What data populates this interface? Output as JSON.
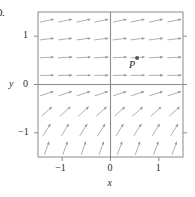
{
  "figure": {
    "number_label": "0.",
    "point_label": "P"
  },
  "axes": {
    "xlabel": "x",
    "ylabel": "y",
    "xticks": [
      "−1",
      "0",
      "1"
    ],
    "yticks": [
      "1",
      "0",
      "−1"
    ]
  },
  "colors": {
    "frame": "#8a8a8a",
    "axis": "#8a8a8a",
    "arrow": "#9a9a9a",
    "text": "#1a1a1a",
    "point": "#555555",
    "background": "#ffffff"
  },
  "chart_data": {
    "type": "scatter",
    "title": "",
    "xlabel": "x",
    "ylabel": "y",
    "xlim": [
      -1.5,
      1.5
    ],
    "ylim": [
      -1.5,
      1.5
    ],
    "xtick_values": [
      -1,
      0,
      1
    ],
    "ytick_values": [
      1,
      0,
      -1
    ],
    "grid": false,
    "legend": null,
    "annotations": [
      {
        "label": "P",
        "x": 0.55,
        "y": 0.55,
        "marker": "dot"
      }
    ],
    "field": {
      "grid_x": [
        -1.32,
        -0.94,
        -0.56,
        -0.19,
        0.19,
        0.56,
        0.94,
        1.32
      ],
      "grid_y": [
        1.32,
        0.94,
        0.56,
        0.19,
        -0.19,
        -0.56,
        -0.94,
        -1.32
      ],
      "angles_deg_by_row": [
        12,
        7,
        3,
        1,
        18,
        42,
        58,
        70
      ],
      "arrow_length_px": 14,
      "note": "angle measured counterclockwise from +x axis; same angle applied across each row"
    },
    "series": [
      {
        "name": "point P",
        "x": [
          0.55
        ],
        "y": [
          0.55
        ]
      }
    ]
  }
}
